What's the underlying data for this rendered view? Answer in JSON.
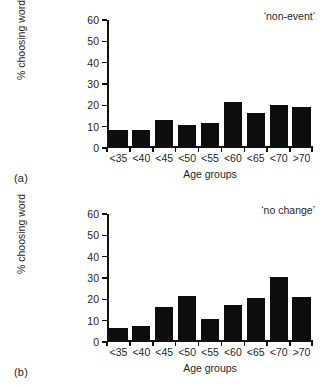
{
  "figure": {
    "panels": [
      {
        "letter": "(a)",
        "annotation": "‘non-event’",
        "chart_data": {
          "type": "bar",
          "title": "‘non-event’",
          "categories": [
            "<35",
            "<40",
            "<45",
            "<50",
            "<55",
            "<60",
            "<65",
            "<70",
            ">70"
          ],
          "values": [
            8,
            8,
            12.5,
            10,
            11,
            21,
            16,
            19.5,
            18.5
          ],
          "xlabel": "Age groups",
          "ylabel": "% choosing word",
          "ylim": [
            0,
            60
          ],
          "yticks": [
            0,
            10,
            20,
            30,
            40,
            50,
            60
          ],
          "ytick_labels": [
            "0",
            "10",
            "20",
            "30",
            "40",
            "50",
            "60"
          ],
          "grid": false,
          "legend": false,
          "bar_color": "#0d0d0d"
        }
      },
      {
        "letter": "(b)",
        "annotation": "‘no change’",
        "chart_data": {
          "type": "bar",
          "title": "‘no change’",
          "categories": [
            "<35",
            "<40",
            "<45",
            "<50",
            "<55",
            "<60",
            "<65",
            "<70",
            ">70"
          ],
          "values": [
            6,
            7,
            16,
            21,
            10,
            17,
            20,
            30,
            20.5
          ],
          "xlabel": "Age groups",
          "ylabel": "% choosing word",
          "ylim": [
            0,
            60
          ],
          "yticks": [
            0,
            10,
            20,
            30,
            40,
            50,
            60
          ],
          "ytick_labels": [
            "0",
            "10",
            "20",
            "30",
            "40",
            "50",
            "60"
          ],
          "grid": false,
          "legend": false,
          "bar_color": "#0d0d0d"
        }
      }
    ]
  }
}
